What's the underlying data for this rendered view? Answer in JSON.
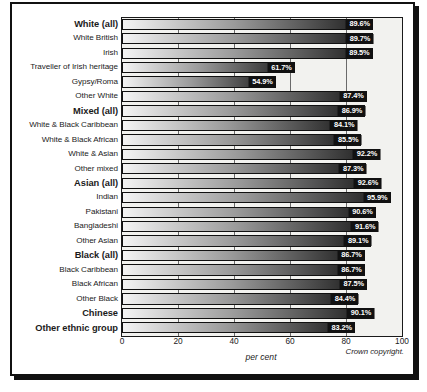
{
  "figure": {
    "x_axis_title": "per cent",
    "copyright": "Crown copyright.",
    "accent_color": "#111111",
    "plot_background": "#f2f2ef"
  },
  "chart_data": {
    "type": "bar",
    "orientation": "horizontal",
    "title": "",
    "xlabel": "per cent",
    "ylabel": "",
    "xlim": [
      0,
      100
    ],
    "xticks": [
      0,
      20,
      40,
      60,
      80,
      100
    ],
    "xticklabels": [
      "0",
      "20",
      "40",
      "60",
      "80",
      "100"
    ],
    "grid": true,
    "legend": null,
    "value_suffix": "%",
    "categories": [
      "White (all)",
      "White British",
      "Irish",
      "Traveller of Irish heritage",
      "Gypsy/Roma",
      "Other White",
      "Mixed (all)",
      "White & Black Caribbean",
      "White & Black African",
      "White & Asian",
      "Other mixed",
      "Asian (all)",
      "Indian",
      "Pakistani",
      "Bangladeshi",
      "Other Asian",
      "Black (all)",
      "Black Caribbean",
      "Black African",
      "Other Black",
      "Chinese",
      "Other ethnic group"
    ],
    "values": [
      89.6,
      89.7,
      89.5,
      61.7,
      54.9,
      87.4,
      86.9,
      84.1,
      85.5,
      92.2,
      87.3,
      92.6,
      95.9,
      90.6,
      91.6,
      89.1,
      86.7,
      86.7,
      87.5,
      84.4,
      90.1,
      83.2
    ],
    "value_labels": [
      "89.6%",
      "89.7%",
      "89.5%",
      "61.7%",
      "54.9%",
      "87.4%",
      "86.9%",
      "84.1%",
      "85.5%",
      "92.2%",
      "87.3%",
      "92.6%",
      "95.9%",
      "90.6%",
      "91.6%",
      "89.1%",
      "86.7%",
      "86.7%",
      "87.5%",
      "84.4%",
      "90.1%",
      "83.2%"
    ],
    "emphasis": [
      true,
      false,
      false,
      false,
      false,
      false,
      true,
      false,
      false,
      false,
      false,
      true,
      false,
      false,
      false,
      false,
      true,
      false,
      false,
      false,
      true,
      true
    ]
  }
}
